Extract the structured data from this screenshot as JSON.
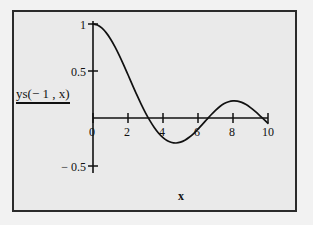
{
  "figure": {
    "background_color": "#f2f2f2",
    "panel_color": "#eaeaea",
    "border_color": "#2b2b2b",
    "curve_color": "#111111"
  },
  "labels": {
    "y_axis_label": "ys(− 1 , x)",
    "x_axis_label": "x"
  },
  "ticks": {
    "x": [
      "0",
      "2",
      "4",
      "6",
      "8",
      "10"
    ],
    "y": [
      "1",
      "0.5",
      "− 0.5"
    ]
  },
  "ghost": {
    "line1": "born in Egypt in 1924",
    "line2": "Cairo, Egypt in 1950"
  },
  "chart_data": {
    "type": "line",
    "title": "",
    "xlabel": "x",
    "ylabel": "ys(-1, x)",
    "xlim": [
      0,
      10
    ],
    "ylim": [
      -0.5,
      1.05
    ],
    "xticks": [
      0,
      2,
      4,
      6,
      8,
      10
    ],
    "yticks": [
      -0.5,
      0.5,
      1
    ],
    "grid": false,
    "legend": false,
    "axis_style": "spines-at-origin",
    "series": [
      {
        "name": "ys(-1, x)",
        "color": "#111111",
        "x": [
          0.0,
          0.25,
          0.5,
          0.75,
          1.0,
          1.25,
          1.5,
          1.75,
          2.0,
          2.25,
          2.5,
          2.75,
          3.0,
          3.25,
          3.5,
          3.75,
          4.0,
          4.25,
          4.5,
          4.75,
          5.0,
          5.25,
          5.5,
          5.75,
          6.0,
          6.25,
          6.5,
          6.75,
          7.0,
          7.25,
          7.5,
          7.75,
          8.0,
          8.25,
          8.5,
          8.75,
          9.0,
          9.25,
          9.5,
          9.75,
          10.0
        ],
        "y": [
          1.0,
          0.989,
          0.958,
          0.908,
          0.841,
          0.76,
          0.667,
          0.566,
          0.46,
          0.353,
          0.248,
          0.148,
          0.055,
          -0.028,
          -0.101,
          -0.162,
          -0.209,
          -0.242,
          -0.261,
          -0.266,
          -0.257,
          -0.236,
          -0.205,
          -0.165,
          -0.118,
          -0.068,
          -0.016,
          0.035,
          0.082,
          0.122,
          0.153,
          0.173,
          0.182,
          0.18,
          0.166,
          0.143,
          0.111,
          0.073,
          0.031,
          -0.013,
          -0.056
        ]
      }
    ],
    "features": {
      "start_value": 1.0,
      "first_zero_crossing": 3.15,
      "minimum": {
        "x": 4.6,
        "y": -0.27
      },
      "second_zero_crossing": 6.55,
      "maximum": {
        "x": 7.95,
        "y": 0.18
      },
      "third_zero_crossing": 9.4,
      "end_value": -0.056
    }
  }
}
